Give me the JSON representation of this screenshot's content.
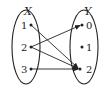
{
  "diagram": {
    "type": "mapping",
    "domain_set": {
      "label": "X",
      "elements": [
        "1",
        "2",
        "3"
      ]
    },
    "codomain_set": {
      "label": "Y",
      "elements": [
        "0",
        "1",
        "2"
      ]
    },
    "arrows": [
      {
        "from": "1",
        "to": "2"
      },
      {
        "from": "2",
        "to": "0"
      },
      {
        "from": "2",
        "to": "2"
      },
      {
        "from": "3",
        "to": "2"
      }
    ],
    "colors": {
      "stroke": "#222222",
      "background": "#ffffff"
    }
  }
}
